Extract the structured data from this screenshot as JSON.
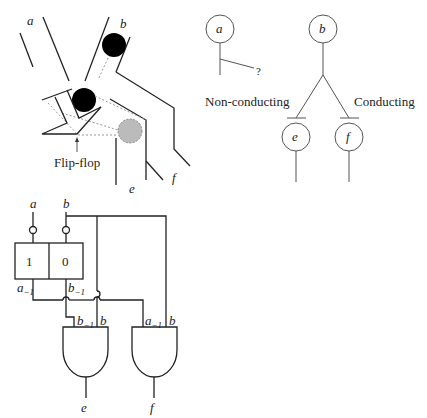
{
  "mechanism": {
    "input_a": "a",
    "input_b": "b",
    "output_e": "e",
    "output_f": "f",
    "flipflop_label": "Flip-flop"
  },
  "state_diagram": {
    "node_a": "a",
    "node_b": "b",
    "node_e": "e",
    "node_f": "f",
    "question_mark": "?",
    "left_branch_label": "Non-conducting",
    "right_branch_label": "Conducting"
  },
  "circuit": {
    "input_a": "a",
    "input_b": "b",
    "flipflop_left_value": "1",
    "flipflop_right_value": "0",
    "out_a_prev": "a",
    "out_b_prev": "b",
    "prev_subscript": "−1",
    "gate_e_in1": "b",
    "gate_e_in2": "b",
    "gate_f_in1": "a",
    "gate_f_in2": "b",
    "output_e": "e",
    "output_f": "f"
  }
}
